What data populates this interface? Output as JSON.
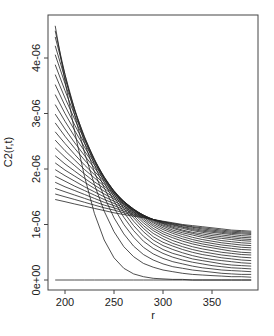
{
  "chart_data": {
    "type": "line",
    "title": "",
    "xlabel": "r",
    "ylabel": "C2(r,t)",
    "xlim": [
      186,
      394
    ],
    "ylim": [
      -1.8e-07,
      4.7e-06
    ],
    "x_ticks": [
      200,
      250,
      300,
      350
    ],
    "x_tick_labels": [
      "200",
      "250",
      "300",
      "350"
    ],
    "y_ticks": [
      0,
      1e-06,
      2e-06,
      3e-06,
      4e-06
    ],
    "y_tick_labels": [
      "0e+00",
      "1e-06",
      "2e-06",
      "3e-06",
      "4e-06"
    ],
    "grid": false,
    "legend": "none",
    "line_color": "#222222",
    "x": [
      190,
      200,
      210,
      220,
      230,
      240,
      250,
      260,
      270,
      280,
      290,
      300,
      310,
      320,
      330,
      340,
      350,
      360,
      370,
      380,
      390
    ],
    "y_unit": 1e-06,
    "series": [
      {
        "name": "t0",
        "values": [
          0,
          0,
          0,
          0,
          0,
          0,
          0,
          0,
          0,
          0,
          0,
          0,
          0,
          0,
          0,
          0,
          0,
          0,
          0,
          0,
          0
        ]
      },
      {
        "name": "t1",
        "values": [
          1.45,
          1.41,
          1.37,
          1.33,
          1.29,
          1.25,
          1.21,
          1.18,
          1.15,
          1.12,
          1.09,
          1.06,
          1.03,
          1.0,
          0.98,
          0.96,
          0.94,
          0.92,
          0.9,
          0.89,
          0.88
        ]
      },
      {
        "name": "t2",
        "values": [
          1.55,
          1.5,
          1.45,
          1.4,
          1.35,
          1.3,
          1.26,
          1.21,
          1.17,
          1.13,
          1.09,
          1.05,
          1.02,
          0.99,
          0.96,
          0.94,
          0.92,
          0.9,
          0.88,
          0.87,
          0.86
        ]
      },
      {
        "name": "t3",
        "values": [
          1.65,
          1.59,
          1.53,
          1.47,
          1.41,
          1.35,
          1.3,
          1.24,
          1.19,
          1.14,
          1.09,
          1.05,
          1.01,
          0.98,
          0.95,
          0.92,
          0.9,
          0.88,
          0.86,
          0.85,
          0.84
        ]
      },
      {
        "name": "t4",
        "values": [
          1.76,
          1.68,
          1.61,
          1.54,
          1.47,
          1.4,
          1.34,
          1.27,
          1.21,
          1.15,
          1.09,
          1.04,
          1.0,
          0.96,
          0.93,
          0.9,
          0.88,
          0.86,
          0.84,
          0.83,
          0.82
        ]
      },
      {
        "name": "t5",
        "values": [
          1.87,
          1.78,
          1.69,
          1.61,
          1.53,
          1.45,
          1.38,
          1.3,
          1.23,
          1.16,
          1.09,
          1.03,
          0.99,
          0.95,
          0.91,
          0.88,
          0.86,
          0.84,
          0.82,
          0.8,
          0.79
        ]
      },
      {
        "name": "t6",
        "values": [
          1.99,
          1.88,
          1.78,
          1.68,
          1.59,
          1.5,
          1.42,
          1.33,
          1.25,
          1.17,
          1.09,
          1.02,
          0.97,
          0.93,
          0.89,
          0.86,
          0.83,
          0.81,
          0.79,
          0.77,
          0.76
        ]
      },
      {
        "name": "t7",
        "values": [
          2.11,
          1.98,
          1.87,
          1.76,
          1.65,
          1.55,
          1.46,
          1.36,
          1.26,
          1.17,
          1.08,
          1.01,
          0.95,
          0.9,
          0.86,
          0.83,
          0.8,
          0.78,
          0.76,
          0.74,
          0.73
        ]
      },
      {
        "name": "t8",
        "values": [
          2.24,
          2.09,
          1.96,
          1.83,
          1.71,
          1.6,
          1.49,
          1.38,
          1.27,
          1.17,
          1.07,
          0.99,
          0.93,
          0.88,
          0.84,
          0.8,
          0.77,
          0.75,
          0.73,
          0.71,
          0.7
        ]
      },
      {
        "name": "t9",
        "values": [
          2.38,
          2.21,
          2.06,
          1.91,
          1.77,
          1.65,
          1.52,
          1.4,
          1.28,
          1.16,
          1.05,
          0.97,
          0.9,
          0.85,
          0.81,
          0.77,
          0.74,
          0.71,
          0.69,
          0.67,
          0.66
        ]
      },
      {
        "name": "t10",
        "values": [
          2.52,
          2.33,
          2.16,
          1.99,
          1.84,
          1.69,
          1.55,
          1.41,
          1.28,
          1.15,
          1.03,
          0.94,
          0.87,
          0.82,
          0.77,
          0.73,
          0.7,
          0.67,
          0.65,
          0.63,
          0.62
        ]
      },
      {
        "name": "t11",
        "values": [
          2.67,
          2.46,
          2.26,
          2.07,
          1.9,
          1.73,
          1.57,
          1.42,
          1.27,
          1.13,
          1.0,
          0.91,
          0.84,
          0.78,
          0.73,
          0.69,
          0.66,
          0.63,
          0.61,
          0.59,
          0.58
        ]
      },
      {
        "name": "t12",
        "values": [
          2.83,
          2.59,
          2.37,
          2.16,
          1.96,
          1.77,
          1.59,
          1.42,
          1.26,
          1.1,
          0.97,
          0.87,
          0.8,
          0.74,
          0.69,
          0.65,
          0.62,
          0.59,
          0.57,
          0.55,
          0.54
        ]
      },
      {
        "name": "t13",
        "values": [
          2.99,
          2.72,
          2.47,
          2.24,
          2.02,
          1.8,
          1.6,
          1.41,
          1.23,
          1.07,
          0.93,
          0.83,
          0.76,
          0.7,
          0.65,
          0.61,
          0.58,
          0.55,
          0.52,
          0.5,
          0.49
        ]
      },
      {
        "name": "t14",
        "values": [
          3.16,
          2.86,
          2.58,
          2.32,
          2.07,
          1.83,
          1.61,
          1.4,
          1.2,
          1.03,
          0.89,
          0.79,
          0.71,
          0.65,
          0.6,
          0.56,
          0.53,
          0.5,
          0.48,
          0.46,
          0.45
        ]
      },
      {
        "name": "t15",
        "values": [
          3.34,
          3.0,
          2.69,
          2.39,
          2.11,
          1.85,
          1.6,
          1.37,
          1.16,
          0.98,
          0.84,
          0.74,
          0.66,
          0.6,
          0.55,
          0.51,
          0.48,
          0.45,
          0.43,
          0.41,
          0.4
        ]
      },
      {
        "name": "t16",
        "values": [
          3.52,
          3.14,
          2.79,
          2.46,
          2.15,
          1.86,
          1.59,
          1.34,
          1.12,
          0.93,
          0.78,
          0.68,
          0.61,
          0.55,
          0.5,
          0.46,
          0.43,
          0.4,
          0.38,
          0.36,
          0.35
        ]
      },
      {
        "name": "t17",
        "values": [
          3.7,
          3.28,
          2.89,
          2.52,
          2.17,
          1.85,
          1.55,
          1.29,
          1.06,
          0.87,
          0.72,
          0.62,
          0.55,
          0.49,
          0.44,
          0.4,
          0.37,
          0.35,
          0.33,
          0.31,
          0.3
        ]
      },
      {
        "name": "t18",
        "values": [
          3.88,
          3.41,
          2.97,
          2.56,
          2.18,
          1.82,
          1.5,
          1.22,
          0.98,
          0.79,
          0.65,
          0.55,
          0.48,
          0.43,
          0.38,
          0.35,
          0.32,
          0.29,
          0.27,
          0.26,
          0.25
        ]
      },
      {
        "name": "t19",
        "values": [
          4.06,
          3.54,
          3.04,
          2.58,
          2.15,
          1.76,
          1.42,
          1.13,
          0.89,
          0.7,
          0.57,
          0.48,
          0.41,
          0.36,
          0.32,
          0.29,
          0.26,
          0.24,
          0.22,
          0.21,
          0.2
        ]
      },
      {
        "name": "t20",
        "values": [
          4.22,
          3.63,
          3.07,
          2.55,
          2.08,
          1.66,
          1.3,
          1.0,
          0.77,
          0.59,
          0.47,
          0.39,
          0.33,
          0.29,
          0.25,
          0.22,
          0.2,
          0.18,
          0.17,
          0.16,
          0.15
        ]
      },
      {
        "name": "t21",
        "values": [
          4.38,
          3.7,
          3.06,
          2.47,
          1.95,
          1.5,
          1.12,
          0.83,
          0.61,
          0.46,
          0.36,
          0.29,
          0.24,
          0.21,
          0.18,
          0.16,
          0.14,
          0.12,
          0.11,
          0.1,
          0.1
        ]
      },
      {
        "name": "t22",
        "values": [
          4.49,
          3.7,
          2.96,
          2.29,
          1.72,
          1.24,
          0.87,
          0.6,
          0.42,
          0.3,
          0.23,
          0.18,
          0.15,
          0.12,
          0.1,
          0.09,
          0.08,
          0.07,
          0.06,
          0.06,
          0.05
        ]
      },
      {
        "name": "t23",
        "values": [
          4.58,
          3.58,
          2.66,
          1.86,
          1.2,
          0.72,
          0.4,
          0.21,
          0.11,
          0.06,
          0.03,
          0.02,
          0.01,
          0.01,
          0,
          0,
          0,
          0,
          0,
          0,
          0
        ]
      }
    ]
  }
}
